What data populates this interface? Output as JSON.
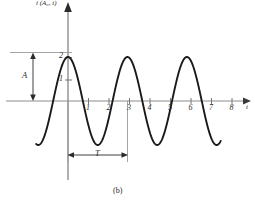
{
  "figure": {
    "caption": "(b)",
    "y_axis_label": "i (A₀, t)",
    "x_axis_label": "t",
    "amplitude_label": "A",
    "period_label": "T"
  },
  "chart_data": {
    "type": "line",
    "title": "",
    "subtitle": "",
    "xlabel": "t",
    "ylabel": "i (A₀, t)",
    "xlim": [
      -1.6,
      8.6
    ],
    "ylim": [
      -2.2,
      2.6
    ],
    "xticks": [
      1,
      2,
      3,
      4,
      5,
      6,
      7,
      8
    ],
    "xtick_labels": [
      "1",
      "2",
      "3",
      "4",
      "5",
      "6",
      "7",
      "8"
    ],
    "yticks": [
      1,
      2
    ],
    "ytick_labels": [
      "1",
      "2"
    ],
    "grid": false,
    "legend": null,
    "annotations": [
      {
        "name": "amplitude",
        "label": "A",
        "value": 2,
        "from_y": 0,
        "to_y": 2,
        "style": "double-arrow-vertical"
      },
      {
        "name": "period",
        "label": "T",
        "value": 2.9,
        "from_x": 0,
        "to_x": 2.9,
        "style": "double-arrow-horizontal"
      },
      {
        "name": "peak-reference-line",
        "y": 2,
        "style": "horizontal-guide"
      },
      {
        "name": "period-guide-left",
        "x": 0,
        "style": "vertical-guide"
      },
      {
        "name": "period-guide-right",
        "x": 2.9,
        "style": "vertical-guide"
      },
      {
        "name": "caption",
        "label": "(b)"
      }
    ],
    "series": [
      {
        "name": "i(A0, t)",
        "amplitude": 2,
        "period": 2.9,
        "phase": "cosine",
        "function": "2*cos(2*pi*t/2.9)",
        "x_start": -1.55,
        "x_end": 7.45,
        "color": "#1a1a1a",
        "x": [
          -1.55,
          -1.4,
          -1.2,
          -1.0,
          -0.8,
          -0.6,
          -0.4,
          -0.2,
          0.0,
          0.2,
          0.4,
          0.6,
          0.8,
          1.0,
          1.2,
          1.4,
          1.45,
          1.6,
          1.8,
          2.0,
          2.2,
          2.4,
          2.6,
          2.8,
          2.9,
          3.0,
          3.2,
          3.4,
          3.6,
          3.8,
          4.0,
          4.2,
          4.35,
          4.6,
          4.8,
          5.0,
          5.2,
          5.4,
          5.6,
          5.8,
          5.8,
          6.0,
          6.2,
          6.4,
          6.6,
          6.8,
          7.0,
          7.2,
          7.45
        ],
        "y": [
          -0.64,
          -0.11,
          0.56,
          1.15,
          1.62,
          1.9,
          2.0,
          1.91,
          2.0,
          1.91,
          1.63,
          1.17,
          0.58,
          -0.09,
          -0.75,
          -1.35,
          -1.48,
          -1.73,
          -1.97,
          -1.96,
          -1.7,
          -1.2,
          -0.56,
          0.13,
          0.5,
          0.79,
          1.42,
          1.84,
          2.0,
          1.85,
          1.45,
          0.83,
          0.31,
          -0.83,
          -1.47,
          -1.87,
          -2.0,
          -1.8,
          -1.36,
          -0.74,
          -0.74,
          -0.05,
          0.65,
          1.29,
          1.75,
          1.98,
          1.93,
          1.59,
          0.7
        ]
      }
    ]
  }
}
